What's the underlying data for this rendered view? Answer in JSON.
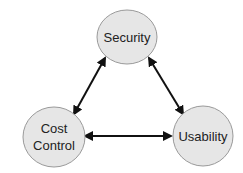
{
  "diagram": {
    "type": "triangle-tradeoff",
    "nodes": [
      {
        "id": "security",
        "lines": [
          "Security"
        ]
      },
      {
        "id": "cost-control",
        "lines": [
          "Cost",
          "Control"
        ]
      },
      {
        "id": "usability",
        "lines": [
          "Usability"
        ]
      }
    ],
    "edges": [
      {
        "from": "security",
        "to": "cost-control",
        "direction": "bidirectional"
      },
      {
        "from": "security",
        "to": "usability",
        "direction": "bidirectional"
      },
      {
        "from": "cost-control",
        "to": "usability",
        "direction": "bidirectional"
      }
    ],
    "colors": {
      "node_fill": "#e6e6e6",
      "node_stroke": "#9a9a9a",
      "edge": "#111111",
      "text": "#222222"
    }
  }
}
